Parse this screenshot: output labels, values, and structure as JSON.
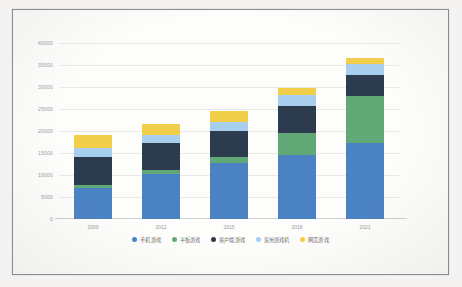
{
  "chart_data": {
    "type": "bar",
    "stacked": true,
    "title": "",
    "subtitle": "",
    "xlabel": "",
    "ylabel": "",
    "categories": [
      "2009",
      "2012",
      "2015",
      "2018",
      "2021"
    ],
    "ylim": [
      0,
      40000
    ],
    "yticks": [
      "0",
      "5000",
      "10000",
      "15000",
      "20000",
      "25000",
      "30000",
      "35000",
      "40000"
    ],
    "ytick_values": [
      0,
      5000,
      10000,
      15000,
      20000,
      25000,
      30000,
      35000,
      40000
    ],
    "grid": true,
    "legend_position": "bottom",
    "series": [
      {
        "name": "手机游戏",
        "color": "#4a82c4",
        "values": [
          7000,
          10300,
          12800,
          14600,
          17300
        ]
      },
      {
        "name": "平板游戏",
        "color": "#5aa islands",
        "values": [
          800,
          900,
          1300,
          5000,
          10600
        ]
      },
      {
        "name": "客户端游戏",
        "color": "#2c3b4e",
        "values": [
          6200,
          6000,
          5900,
          6200,
          4800
        ]
      },
      {
        "name": "家用游戏机",
        "color": "#a8cfee",
        "values": [
          2200,
          1800,
          2000,
          2400,
          2600
        ]
      },
      {
        "name": "网页游戏",
        "color": "#f2cf4a",
        "values": [
          3000,
          2500,
          2500,
          1500,
          1400
        ]
      }
    ],
    "totals": [
      19200,
      21500,
      24500,
      29700,
      36700
    ]
  },
  "colors": {
    "series_1": "#4a82c4",
    "series_2": "#62a877",
    "series_3": "#2c3b4e",
    "series_4": "#a8cfee",
    "series_5": "#f2cf4a",
    "grid": "#e9e9e7",
    "axis": "#cfcfcd",
    "tick_text": "#9a9a97",
    "legend_text": "#6f6f6d",
    "frame": "#8c8c8c",
    "page_background": "#f4f3f1",
    "plot_background": "#fdfdfc"
  }
}
